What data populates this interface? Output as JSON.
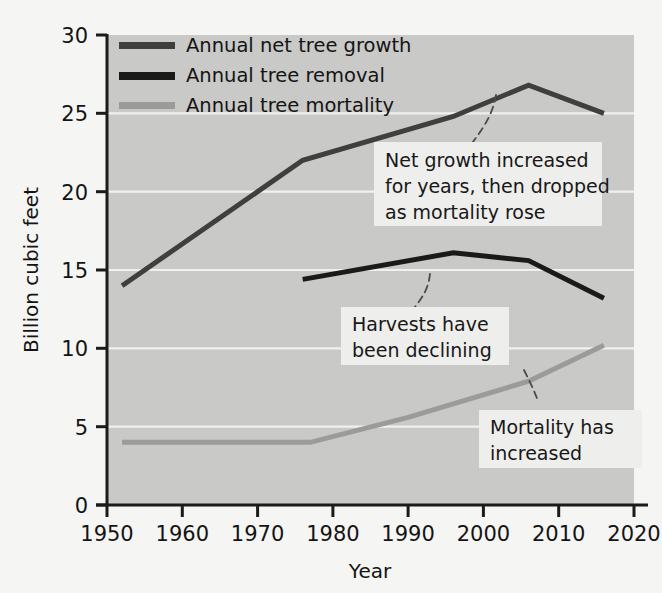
{
  "chart_data": {
    "type": "line",
    "title": "",
    "subtitle": "",
    "xlabel": "Year",
    "ylabel": "Billion cubic feet",
    "xlim": [
      1950,
      2020
    ],
    "ylim": [
      0,
      30
    ],
    "xticks": [
      "1950",
      "1960",
      "1970",
      "1980",
      "1990",
      "2000",
      "2010",
      "2020"
    ],
    "yticks": [
      "0",
      "5",
      "10",
      "15",
      "20",
      "25",
      "30"
    ],
    "grid": "horizontal-white",
    "legend_position": "top-left-inside",
    "series": [
      {
        "name": "Annual net tree growth",
        "color": "#3f3f3f",
        "width": 5,
        "x": [
          1952,
          1976,
          1996,
          2006,
          2016
        ],
        "values": [
          14.0,
          22.0,
          24.8,
          26.8,
          25.0
        ]
      },
      {
        "name": "Annual tree removal",
        "color": "#1a1a1a",
        "width": 5,
        "x": [
          1976,
          1996,
          2006,
          2016
        ],
        "values": [
          14.4,
          16.1,
          15.6,
          13.2
        ]
      },
      {
        "name": "Annual tree mortality",
        "color": "#9b9b9b",
        "width": 5,
        "x": [
          1952,
          1977,
          1990,
          2006,
          2016
        ],
        "values": [
          4.0,
          4.0,
          5.6,
          7.9,
          10.2
        ]
      }
    ],
    "annotations": [
      {
        "id": "net-growth-note",
        "lines": [
          "Net growth increased",
          "for years, then dropped",
          "as mortality rose"
        ],
        "points_to_series": "Annual net tree growth"
      },
      {
        "id": "harvest-note",
        "lines": [
          "Harvests have",
          "been declining"
        ],
        "points_to_series": "Annual tree removal"
      },
      {
        "id": "mortality-note",
        "lines": [
          "Mortality has",
          "increased"
        ],
        "points_to_series": "Annual tree mortality"
      }
    ],
    "colors": {
      "plot_background": "#c9c9c7",
      "page_background": "#f5f5f3",
      "gridline": "#f0f0ee",
      "axis": "#1b1b1b",
      "callout_background": "#eeeeec"
    }
  }
}
